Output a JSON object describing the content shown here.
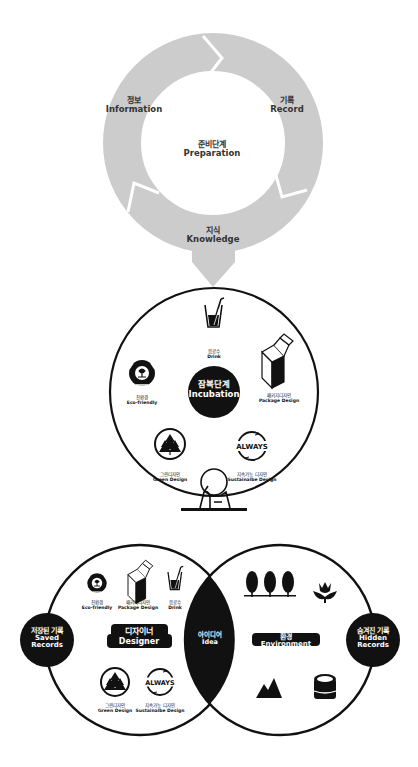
{
  "cycle": {
    "center": {
      "ko": "준비단계",
      "en": "Preparation"
    },
    "segments": [
      {
        "ko": "정보",
        "en": "Information"
      },
      {
        "ko": "기록",
        "en": "Record"
      },
      {
        "ko": "지식",
        "en": "Knowledge"
      }
    ],
    "ring_color": "#cccccc"
  },
  "incubation": {
    "center": {
      "ko": "잠복단계",
      "en": "Incubation"
    },
    "items": [
      {
        "icon": "drink-cup-icon",
        "ko": "음료수",
        "en": "Drink"
      },
      {
        "icon": "package-box-icon",
        "ko": "패키지디자인",
        "en": "Package Design"
      },
      {
        "icon": "recycle-eco-icon",
        "ko": "친환경",
        "en": "Eco-friendly"
      },
      {
        "icon": "trees-circle-icon",
        "ko": "그린디자인",
        "en": "Green Design"
      },
      {
        "icon": "always-cycle-icon",
        "ko": "지속가능 디자인",
        "en": "Sustainalbe Design"
      }
    ],
    "always_text": "ALWAYS"
  },
  "venn": {
    "left": {
      "title": {
        "ko": "디자이너",
        "en": "Designer"
      },
      "side": {
        "ko": "저장된 기록",
        "en1": "Saved",
        "en2": "Records"
      },
      "items": [
        {
          "icon": "recycle-eco-icon",
          "ko": "친환경",
          "en": "Eco-friendly"
        },
        {
          "icon": "package-box-icon",
          "ko": "패키지디자인",
          "en": "Package Design"
        },
        {
          "icon": "drink-cup-icon",
          "ko": "음료수",
          "en": "Drink"
        },
        {
          "icon": "trees-circle-icon",
          "ko": "그린디자인",
          "en": "Green Design"
        },
        {
          "icon": "always-cycle-icon",
          "ko": "지속가능 디자인",
          "en": "Sustainalbe Design"
        }
      ]
    },
    "intersection": {
      "ko": "아이디어",
      "en": "Idea"
    },
    "right": {
      "title": {
        "ko": "환경",
        "en": "Environment"
      },
      "side": {
        "ko": "숨겨진 기록",
        "en1": "Hidden",
        "en2": "Records"
      },
      "icons": [
        "three-trees-icon",
        "tulip-icon",
        "mountain-icon",
        "tree-stump-icon"
      ]
    }
  }
}
